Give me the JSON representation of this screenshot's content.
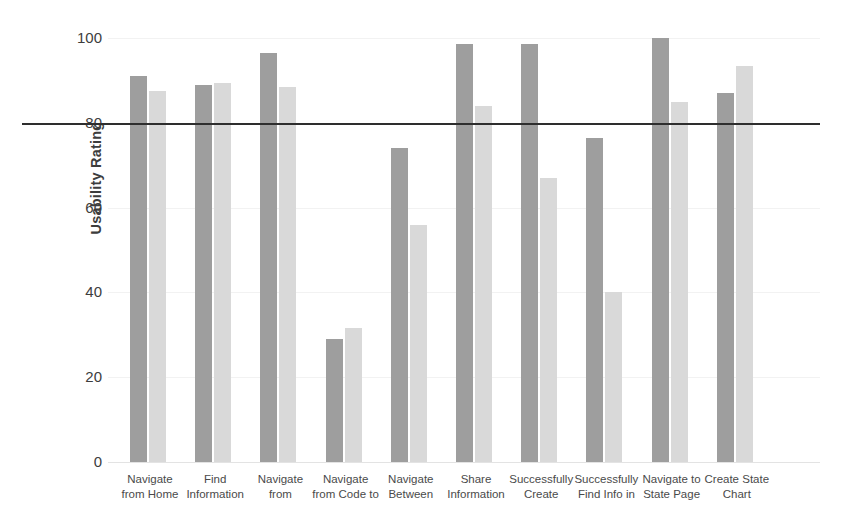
{
  "chart_data": {
    "type": "bar",
    "title": "",
    "subtitle": "",
    "xlabel": "",
    "ylabel": "Usability Rating",
    "ylim": [
      0,
      100
    ],
    "yticks": [
      0,
      20,
      40,
      60,
      80,
      100
    ],
    "ytick_labels": [
      "0",
      "20",
      "40",
      "60",
      "80",
      "100"
    ],
    "grid": true,
    "legend": "none",
    "categories": [
      "Navigate from Home",
      "Find Information",
      "Navigate from",
      "Navigate from Code to",
      "Navigate Between",
      "Share Information",
      "Successfully Create",
      "Successfully Find Info in",
      "Navigate to State Page",
      "Create State Chart"
    ],
    "category_lines": [
      [
        "Navigate",
        "from Home"
      ],
      [
        "Find",
        "Information"
      ],
      [
        "Navigate",
        "from"
      ],
      [
        "Navigate",
        "from Code to"
      ],
      [
        "Navigate",
        "Between"
      ],
      [
        "Share",
        "Information"
      ],
      [
        "Successfully",
        "Create"
      ],
      [
        "Successfully",
        "Find Info in"
      ],
      [
        "Navigate to",
        "State Page"
      ],
      [
        "Create State",
        "Chart"
      ]
    ],
    "series": [
      {
        "name": "series-1",
        "color": "#9e9e9e",
        "values": [
          91,
          89,
          96.5,
          29,
          74,
          98.5,
          98.5,
          76.5,
          100,
          87
        ]
      },
      {
        "name": "series-2",
        "color": "#d9d9d9",
        "values": [
          87.5,
          89.5,
          88.5,
          31.5,
          56,
          84,
          67,
          40,
          85,
          93.5
        ]
      }
    ],
    "annotations": [
      {
        "name": "threshold-line",
        "type": "hline",
        "value": 80,
        "color": "#2e2e2e"
      }
    ]
  }
}
